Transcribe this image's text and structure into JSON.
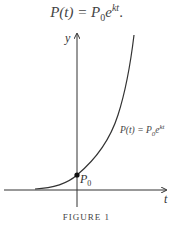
{
  "equation": {
    "lhs": "P(t) = P",
    "sub": "0",
    "base": "e",
    "exp": "kt",
    "trail": "."
  },
  "figure": {
    "axis_labels": {
      "y": "y",
      "x": "t"
    },
    "curve_label": {
      "lhs": "P(t) = P",
      "sub": "0",
      "base": "e",
      "exp": "kt"
    },
    "point_label": {
      "main": "P",
      "sub": "0"
    },
    "caption": "FIGURE 1"
  },
  "colors": {
    "ink": "#333333",
    "background": "#ffffff"
  }
}
